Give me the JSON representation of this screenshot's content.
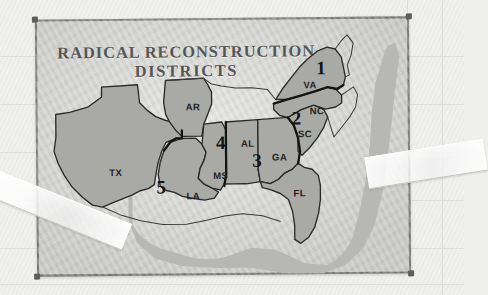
{
  "document": {
    "kind": "photographed-map-sheet",
    "title_line1": "RADICAL RECONSTRUCTION",
    "title_line2": "DISTRICTS"
  },
  "colors": {
    "paper_background": "#eeeeec",
    "sheet_paper": "#d9d9d6",
    "sheet_border": "#6e6e6c",
    "state_fill": "#a9a9a6",
    "ocean_halo": "#b7b7b4",
    "outline": "#2a2a28",
    "title_text": "#565654",
    "label_text": "#1f1f1f",
    "tape": "#fbfbfb",
    "rule_line": "#dcdcda"
  },
  "map": {
    "states": [
      {
        "abbr": "TX",
        "name": "Texas",
        "district": "5",
        "label_x": 74,
        "label_y": 153
      },
      {
        "abbr": "LA",
        "name": "Louisiana",
        "district": "5",
        "label_x": 152,
        "label_y": 177
      },
      {
        "abbr": "AR",
        "name": "Arkansas",
        "district": "4",
        "label_x": 152,
        "label_y": 89
      },
      {
        "abbr": "MS",
        "name": "Mississippi",
        "district": "4",
        "label_x": 179,
        "label_y": 157
      },
      {
        "abbr": "AL",
        "name": "Alabama",
        "district": "3",
        "label_x": 207,
        "label_y": 127
      },
      {
        "abbr": "GA",
        "name": "Georgia",
        "district": "3",
        "label_x": 238,
        "label_y": 141
      },
      {
        "abbr": "FL",
        "name": "Florida",
        "district": "3",
        "label_x": 258,
        "label_y": 176
      },
      {
        "abbr": "SC",
        "name": "South Carolina",
        "district": "2",
        "label_x": 263,
        "label_y": 117
      },
      {
        "abbr": "NC",
        "name": "North Carolina",
        "district": "2",
        "label_x": 275,
        "label_y": 95
      },
      {
        "abbr": "VA",
        "name": "Virginia",
        "district": "1",
        "label_x": 270,
        "label_y": 70
      }
    ],
    "districts": [
      {
        "number": "1",
        "states": [
          "VA"
        ],
        "label_x": 281,
        "label_y": 50
      },
      {
        "number": "2",
        "states": [
          "NC",
          "SC"
        ],
        "label_x": 256,
        "label_y": 100
      },
      {
        "number": "3",
        "states": [
          "AL",
          "GA",
          "FL"
        ],
        "label_x": 216,
        "label_y": 142
      },
      {
        "number": "4",
        "states": [
          "AR",
          "MS"
        ],
        "label_x": 182,
        "label_y": 124
      },
      {
        "number": "5",
        "states": [
          "TX",
          "LA"
        ],
        "label_x": 121,
        "label_y": 168
      }
    ]
  },
  "annotations": {
    "tape_left": "tape-strip-lower-left",
    "tape_right": "tape-strip-right",
    "tack_marks": [
      "top-left",
      "top-right",
      "bottom-left",
      "bottom-right"
    ]
  }
}
